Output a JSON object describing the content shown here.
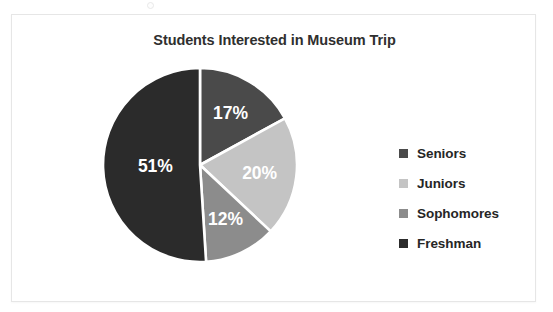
{
  "chart_data": {
    "type": "pie",
    "title": "Students Interested in Museum Trip",
    "categories": [
      "Seniors",
      "Juniors",
      "Sophomores",
      "Freshman"
    ],
    "values": [
      17,
      20,
      12,
      51
    ],
    "value_labels": [
      "17%",
      "20%",
      "12%",
      "51%"
    ],
    "unit": "%",
    "colors": [
      "#4a4a4a",
      "#c4c4c4",
      "#8c8c8c",
      "#2b2b2b"
    ],
    "slice_separator_color": "#ffffff",
    "start_angle_deg": 0,
    "direction": "clockwise",
    "legend_position": "right",
    "legend_entries": [
      {
        "label": "Seniors",
        "color": "#4a4a4a",
        "value": 17
      },
      {
        "label": "Juniors",
        "color": "#c4c4c4",
        "value": 20
      },
      {
        "label": "Sophomores",
        "color": "#8c8c8c",
        "value": 12
      },
      {
        "label": "Freshman",
        "color": "#2b2b2b",
        "value": 51
      }
    ],
    "xlabel": "",
    "ylabel": "",
    "grid": false
  },
  "frame": {
    "background": "#ffffff",
    "border_color": "#e6e6e6"
  }
}
